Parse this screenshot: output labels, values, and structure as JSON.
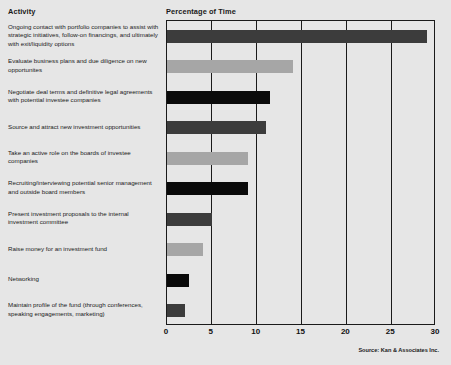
{
  "header": {
    "activity_label": "Activity",
    "percentage_label": "Percentage of Time"
  },
  "source_note": "Source: Kan & Associates Inc.",
  "palette": {
    "background": "#e6e6e6",
    "frame": "#1a1a1a",
    "dark_gray": "#3c3c3c",
    "light_gray": "#a6a6a6",
    "black": "#0a0a0a"
  },
  "chart_data": {
    "type": "bar",
    "orientation": "horizontal",
    "title": "Percentage of Time",
    "xlabel": "",
    "ylabel": "Activity",
    "xlim": [
      0,
      30
    ],
    "xticks": [
      0,
      5,
      10,
      15,
      20,
      25,
      30
    ],
    "grid": true,
    "legend": false,
    "categories": [
      "Ongoing contact with portfolio companies to assist with strategic initiatives, follow-on financings, and ultimately with exit/liquidity options",
      "Evaluate business plans and due diligence on new opportunites",
      "Negotiate deal terms and definitive legal agreements with potential investee companies",
      "Source and attract new investment opportunities",
      "Take an active role on the boards of investee companies",
      "Recruiting/interviewing potential senior management and outside board members",
      "Present investment proposals to the internal investment committee",
      "Raise money for an investment fund",
      "Networking",
      "Maintain profile of the fund (through conferences, speaking engagements, marketing)"
    ],
    "values": [
      29,
      14,
      11.5,
      11,
      9,
      9,
      5,
      4,
      2.5,
      2
    ],
    "colors": [
      "#3c3c3c",
      "#a6a6a6",
      "#0a0a0a",
      "#3c3c3c",
      "#a6a6a6",
      "#0a0a0a",
      "#3c3c3c",
      "#a6a6a6",
      "#0a0a0a",
      "#3c3c3c"
    ]
  }
}
